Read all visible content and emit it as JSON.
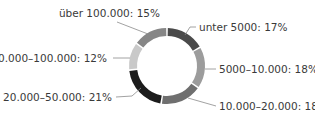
{
  "chart_data": {
    "type": "pie",
    "variant": "donut",
    "title": "",
    "start_angle_deg": 0,
    "direction": "clockwise",
    "legend": "none (inline labels with leader lines)",
    "slices": [
      {
        "label": "unter 5000",
        "value": 17,
        "display": "unter 5000: 17%",
        "color": "#4a4a4a"
      },
      {
        "label": "5000–10.000",
        "value": 18,
        "display": "5000–10.000: 18%",
        "color": "#9c9c9c"
      },
      {
        "label": "10.000–20.000",
        "value": 18,
        "display": "10.000–20.000: 18%",
        "color": "#6f6f6f"
      },
      {
        "label": "20.000–50.000",
        "value": 21,
        "display": "20.000–50.000: 21%",
        "color": "#1c1c1c"
      },
      {
        "label": "50.000–100.000",
        "value": 12,
        "display": "50.000–100.000: 12%",
        "color": "#c9c9c9"
      },
      {
        "label": "über 100.000",
        "value": 15,
        "display": "über 100.000: 15%",
        "color": "#868686"
      }
    ],
    "categories": [
      "unter 5000",
      "5000–10.000",
      "10.000–20.000",
      "20.000–50.000",
      "50.000–100.000",
      "über 100.000"
    ],
    "values": [
      17,
      18,
      18,
      21,
      12,
      15
    ],
    "unit": "%"
  },
  "geometry": {
    "cx": 167,
    "cy": 66,
    "r_outer": 38,
    "r_inner": 30,
    "gap_deg": 2.5
  },
  "labels": [
    {
      "text": "unter 5000: 17%",
      "x": 199,
      "y": 31,
      "anchor": "start",
      "line": [
        [
          185,
          35
        ],
        [
          190,
          27
        ],
        [
          196,
          27
        ]
      ]
    },
    {
      "text": "5000–10.000: 18%",
      "x": 219,
      "y": 73,
      "anchor": "start",
      "line": [
        [
          205,
          69
        ],
        [
          216,
          69
        ]
      ]
    },
    {
      "text": "10.000–20.000: 18%",
      "x": 219,
      "y": 110,
      "anchor": "start",
      "line": [
        [
          188,
          98
        ],
        [
          216,
          106
        ]
      ]
    },
    {
      "text": "20.000–50.000: 21%",
      "x": 112,
      "y": 101,
      "anchor": "end",
      "line": [
        [
          141,
          88
        ],
        [
          132,
          96
        ],
        [
          116,
          97
        ]
      ]
    },
    {
      "text": "50.000–100.000: 12%",
      "x": 107,
      "y": 62,
      "anchor": "end",
      "line": [
        [
          130,
          58
        ],
        [
          113,
          58
        ]
      ]
    },
    {
      "text": "über 100.000: 15%",
      "x": 160,
      "y": 17,
      "anchor": "end",
      "line": [
        [
          148,
          34
        ],
        [
          117,
          22
        ]
      ]
    }
  ]
}
